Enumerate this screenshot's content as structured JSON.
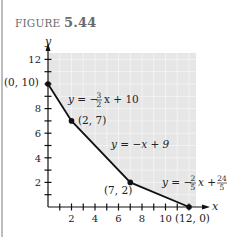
{
  "figure": {
    "prefix": "FIGURE",
    "number": "5.44"
  },
  "colors": {
    "shade": "#e6e6e6",
    "grid": "#f7f7f7",
    "curve": "#111111",
    "axis": "#111111"
  },
  "chart_data": {
    "type": "line",
    "title": "FIGURE 5.44",
    "xlabel": "x",
    "ylabel": "y",
    "xlim": [
      0,
      12.5
    ],
    "ylim": [
      0,
      13
    ],
    "x_ticks": [
      2,
      4,
      6,
      8,
      10
    ],
    "y_ticks": [
      2,
      4,
      6,
      8,
      12
    ],
    "grid": true,
    "shaded_region": "feasible region above the boundary curve",
    "series": [
      {
        "name": "boundary",
        "points": [
          [
            0,
            10
          ],
          [
            2,
            7
          ],
          [
            7,
            2
          ],
          [
            12,
            0
          ]
        ]
      }
    ],
    "point_labels": [
      {
        "x": 0,
        "y": 10,
        "text": "(0, 10)"
      },
      {
        "x": 2,
        "y": 7,
        "text": "(2, 7)"
      },
      {
        "x": 7,
        "y": 2,
        "text": "(7, 2)"
      },
      {
        "x": 12,
        "y": 0,
        "text": "(12, 0)"
      }
    ],
    "equations": [
      {
        "segment": "(0,10)-(2,7)",
        "text": "y = −3/2 x + 10"
      },
      {
        "segment": "(2,7)-(7,2)",
        "text": "y = −x + 9"
      },
      {
        "segment": "(7,2)-(12,0)",
        "text": "y = −2/5 x + 24/5"
      }
    ]
  },
  "labels": {
    "x_axis": "x",
    "y_axis": "y",
    "ticks_x": [
      "2",
      "4",
      "6",
      "8",
      "10"
    ],
    "ticks_y": [
      "2",
      "4",
      "6",
      "8",
      "12"
    ],
    "p0": "(0, 10)",
    "p1": "(2, 7)",
    "p2": "(7, 2)",
    "p3": "(12, 0)",
    "eq1_lhs": "y = −",
    "eq1_num": "3",
    "eq1_den": "2",
    "eq1_rhs": "x + 10",
    "eq2": "y = −x + 9",
    "eq3_lhs": "y = −",
    "eq3_num": "2",
    "eq3_den": "5",
    "eq3_mid": "x +",
    "eq3_num2": "24",
    "eq3_den2": "5"
  }
}
